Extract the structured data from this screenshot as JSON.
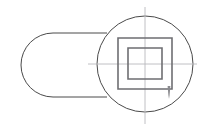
{
  "drawing": {
    "title": "Technical Line Drawing",
    "canvas": {
      "width": 213,
      "height": 130,
      "background_color": "#ffffff"
    },
    "colors": {
      "outline": "#4a4a4a",
      "square": "#6e6e72",
      "centerline": "#b9b9bd",
      "leader": "#8a8a8e"
    },
    "shapes": {
      "stadium": {
        "name": "rounded-rectangle-stadium",
        "left": 21,
        "top": 33,
        "right": 107,
        "bottom": 97,
        "corner_radius": 32
      },
      "circle": {
        "name": "large-circle",
        "center_x": 145,
        "center_y": 64,
        "radius": 48
      },
      "outer_square": {
        "name": "outer-square",
        "left": 118,
        "top": 38,
        "right": 172,
        "bottom": 89
      },
      "inner_square": {
        "name": "inner-square",
        "left": 128,
        "top": 48,
        "right": 162,
        "bottom": 79
      },
      "horizontal_centerline": {
        "name": "horizontal-centerline",
        "x1": 88,
        "x2": 197,
        "y": 64
      },
      "vertical_centerline": {
        "name": "vertical-centerline",
        "x": 145,
        "y1": 7,
        "y2": 124
      },
      "leader_tick": {
        "name": "leader-arrow-tick",
        "x": 169,
        "y_top": 86,
        "y_bottom": 99
      }
    }
  }
}
